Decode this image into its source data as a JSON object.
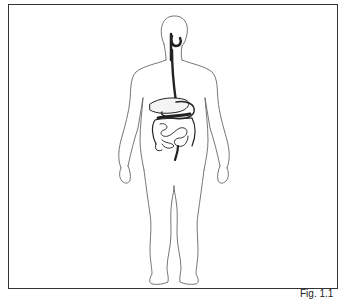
{
  "figure": {
    "parts": [
      "mouth",
      "esophagus",
      "stomach",
      "liver",
      "small-intestine",
      "large-intestine",
      "rectum"
    ],
    "outline_color": "#555555",
    "organ_color": "#222222",
    "frame_color": "#333333"
  },
  "caption": {
    "label": "Fig. 1.1"
  }
}
